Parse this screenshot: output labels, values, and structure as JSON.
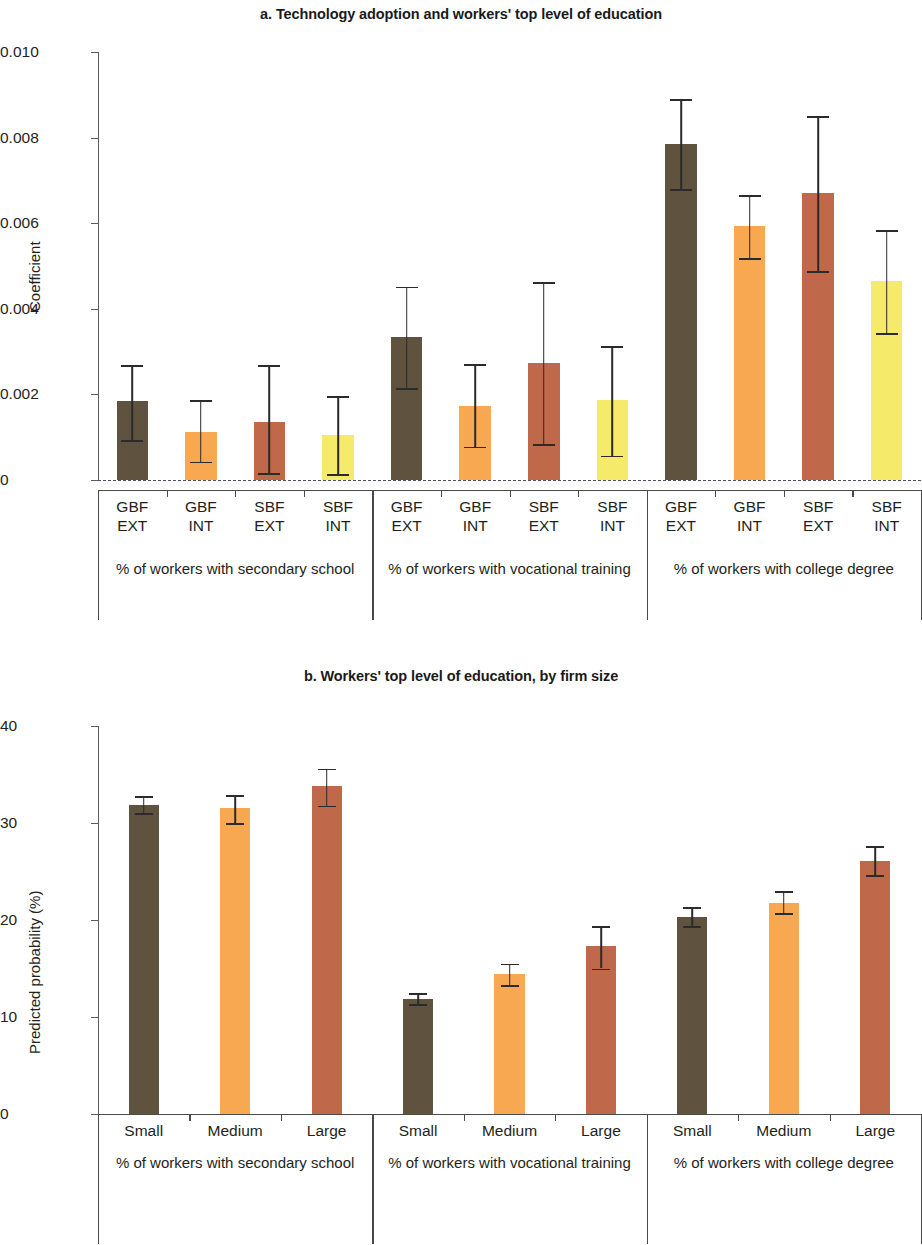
{
  "figure": {
    "panels": [
      {
        "id": "a",
        "title": "a. Technology adoption and workers' top level of education"
      },
      {
        "id": "b",
        "title": "b. Workers' top level of education, by firm size"
      }
    ]
  },
  "colors": {
    "dark_brown": "#5f5340",
    "orange": "#f9a852",
    "terracotta": "#c0694a",
    "yellow": "#f5ea6a",
    "axis": "#4a4a4a",
    "error_bar": "#2b2b2b",
    "zero_line": "#4e4e66"
  },
  "chart_data": [
    {
      "type": "bar",
      "panel": "a",
      "title": "a. Technology adoption and workers' top level of education",
      "xlabel": "",
      "ylabel": "Coefficient",
      "ylim": [
        0,
        0.01
      ],
      "yticks": [
        0,
        0.002,
        0.004,
        0.006,
        0.008,
        0.01
      ],
      "ytick_labels": [
        "0",
        "0.002",
        "0.004",
        "0.006",
        "0.008",
        "0.010"
      ],
      "grid": false,
      "legend": "none",
      "zero_reference_line": true,
      "groups": [
        {
          "label": "% of workers with secondary\nschool",
          "categories": [
            "GBF\nEXT",
            "GBF\nINT",
            "SBF\nEXT",
            "SBF\nINT"
          ],
          "values": [
            0.00185,
            0.00113,
            0.00136,
            0.00104
          ],
          "ci_low": [
            0.00093,
            0.00043,
            0.00017,
            0.00013
          ],
          "ci_high": [
            0.00268,
            0.00186,
            0.00268,
            0.00196
          ],
          "colors": [
            "#5f5340",
            "#f9a852",
            "#c0694a",
            "#f5ea6a"
          ]
        },
        {
          "label": "% of workers with vocational\ntraining",
          "categories": [
            "GBF\nEXT",
            "GBF\nINT",
            "SBF\nEXT",
            "SBF\nINT"
          ],
          "values": [
            0.00335,
            0.00174,
            0.00274,
            0.00186
          ],
          "ci_low": [
            0.00214,
            0.00078,
            0.00084,
            0.00057
          ],
          "ci_high": [
            0.00452,
            0.0027,
            0.00463,
            0.00313
          ],
          "colors": [
            "#5f5340",
            "#f9a852",
            "#c0694a",
            "#f5ea6a"
          ]
        },
        {
          "label": "% of workers with college\ndegree",
          "categories": [
            "GBF\nEXT",
            "GBF\nINT",
            "SBF\nEXT",
            "SBF\nINT"
          ],
          "values": [
            0.00785,
            0.00593,
            0.0067,
            0.00464
          ],
          "ci_low": [
            0.0068,
            0.00519,
            0.00488,
            0.00343
          ],
          "ci_high": [
            0.0089,
            0.00665,
            0.0085,
            0.00584
          ],
          "colors": [
            "#5f5340",
            "#f9a852",
            "#c0694a",
            "#f5ea6a"
          ]
        }
      ]
    },
    {
      "type": "bar",
      "panel": "b",
      "title": "b. Workers' top level of education, by firm size",
      "xlabel": "",
      "ylabel": "Predicted probability (%)",
      "ylim": [
        0,
        40
      ],
      "yticks": [
        0,
        10,
        20,
        30,
        40
      ],
      "ytick_labels": [
        "0",
        "10",
        "20",
        "30",
        "40"
      ],
      "grid": false,
      "legend": "none",
      "zero_reference_line": false,
      "groups": [
        {
          "label": "% of workers with secondary\nschool",
          "categories": [
            "Small",
            "Medium",
            "Large"
          ],
          "values": [
            31.9,
            31.5,
            33.8
          ],
          "ci_low": [
            31.0,
            30.0,
            31.8
          ],
          "ci_high": [
            32.8,
            32.9,
            35.6
          ],
          "colors": [
            "#5f5340",
            "#f9a852",
            "#c0694a"
          ]
        },
        {
          "label": "% of workers with vocational\ntraining",
          "categories": [
            "Small",
            "Medium",
            "Large"
          ],
          "values": [
            11.9,
            14.4,
            17.3
          ],
          "ci_low": [
            11.3,
            13.3,
            15.0
          ],
          "ci_high": [
            12.5,
            15.5,
            19.4
          ],
          "colors": [
            "#5f5340",
            "#f9a852",
            "#c0694a"
          ]
        },
        {
          "label": "% of workers with college\ndegree",
          "categories": [
            "Small",
            "Medium",
            "Large"
          ],
          "values": [
            20.3,
            21.8,
            26.1
          ],
          "ci_low": [
            19.4,
            20.7,
            24.6
          ],
          "ci_high": [
            21.3,
            23.0,
            27.6
          ],
          "colors": [
            "#5f5340",
            "#f9a852",
            "#c0694a"
          ]
        }
      ]
    }
  ]
}
